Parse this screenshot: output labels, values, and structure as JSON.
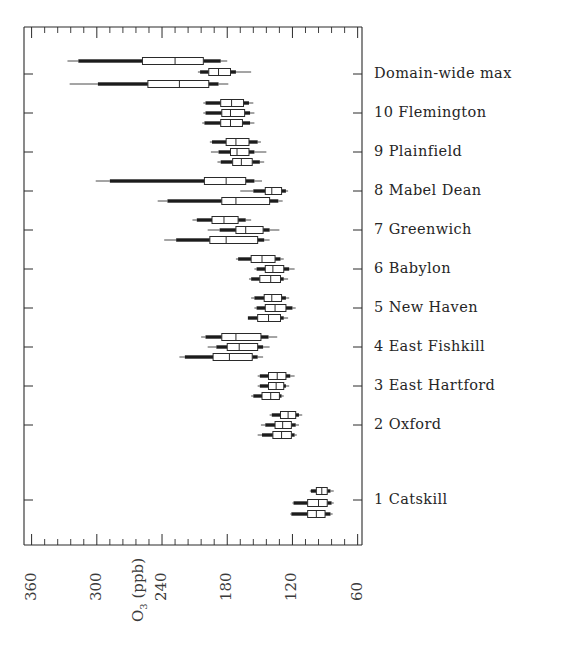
{
  "figure": {
    "kind": "percentile-boxplot-panel",
    "background": "#ffffff",
    "ink": "#1c1c1c"
  },
  "chart_data": {
    "type": "bar",
    "subtype": "horizontal box-and-whisker (percentile) plot, 3 boxes per site",
    "title": "",
    "xlabel": "O₃ (ppb)",
    "ylabel": "",
    "grid": false,
    "legend": "none",
    "x_axis": {
      "label": "O₃ (ppb)",
      "label_main": "O",
      "label_sub": "3",
      "label_unit": "(ppb)",
      "tick_labels": [
        "360",
        "300",
        "240",
        "180",
        "120",
        "60"
      ],
      "tick_values": [
        360,
        300,
        240,
        180,
        120,
        60
      ],
      "range_left_value": 367,
      "range_right_value": 56,
      "reversed": true,
      "minor_ticks_per_interval": 5,
      "ticks_side": "both-top-and-bottom",
      "tick_label_rotation_deg": -90
    },
    "categories": [
      "Domain-wide max",
      "10 Flemington",
      "9 Plainfield",
      "8 Mabel Dean",
      "7 Greenwich",
      "6 Babylon",
      "5 New Haven",
      "4 East Fishkill",
      "3 East Hartford",
      "2 Oxford",
      "1 Catskill"
    ],
    "box_stats_keys": [
      "min",
      "p10",
      "p25",
      "median",
      "p75",
      "p90",
      "max"
    ],
    "groups": [
      {
        "label": "Domain-wide max",
        "label_y": 74,
        "boxes": [
          {
            "y": 61,
            "min": 327,
            "p10": 317,
            "p25": 258,
            "median": 228,
            "p75": 202,
            "p90": 186,
            "max": 180
          },
          {
            "y": 72,
            "min": 207,
            "p10": 205,
            "p25": 197,
            "median": 188,
            "p75": 177,
            "p90": 172,
            "max": 158
          },
          {
            "y": 84,
            "min": 325,
            "p10": 299,
            "p25": 253,
            "median": 224,
            "p75": 197,
            "p90": 188,
            "max": 179
          }
        ]
      },
      {
        "label": "10 Flemington",
        "label_y": 113,
        "boxes": [
          {
            "y": 103,
            "min": 202,
            "p10": 200,
            "p25": 186,
            "median": 176,
            "p75": 165,
            "p90": 160,
            "max": 156
          },
          {
            "y": 113,
            "min": 202,
            "p10": 200,
            "p25": 185,
            "median": 177,
            "p75": 164,
            "p90": 159,
            "max": 155
          },
          {
            "y": 123,
            "min": 203,
            "p10": 201,
            "p25": 186,
            "median": 177,
            "p75": 166,
            "p90": 159,
            "max": 155
          }
        ]
      },
      {
        "label": "9 Plainfield",
        "label_y": 152,
        "boxes": [
          {
            "y": 142,
            "min": 196,
            "p10": 194,
            "p25": 181,
            "median": 172,
            "p75": 160,
            "p90": 152,
            "max": 149
          },
          {
            "y": 152,
            "min": 195,
            "p10": 188,
            "p25": 177,
            "median": 171,
            "p75": 160,
            "p90": 155,
            "max": 144
          },
          {
            "y": 162,
            "min": 189,
            "p10": 186,
            "p25": 175,
            "median": 167,
            "p75": 157,
            "p90": 150,
            "max": 146
          }
        ]
      },
      {
        "label": "8 Mabel Dean",
        "label_y": 191,
        "boxes": [
          {
            "y": 181,
            "min": 301,
            "p10": 288,
            "p25": 201,
            "median": 181,
            "p75": 163,
            "p90": 155,
            "max": 148
          },
          {
            "y": 191,
            "min": 168,
            "p10": 156,
            "p25": 145,
            "median": 139,
            "p75": 130,
            "p90": 126,
            "max": 124
          },
          {
            "y": 201,
            "min": 244,
            "p10": 235,
            "p25": 185,
            "median": 172,
            "p75": 141,
            "p90": 133,
            "max": 129
          }
        ]
      },
      {
        "label": "7 Greenwich",
        "label_y": 230,
        "boxes": [
          {
            "y": 220,
            "min": 212,
            "p10": 208,
            "p25": 194,
            "median": 183,
            "p75": 170,
            "p90": 163,
            "max": 158
          },
          {
            "y": 230,
            "min": 198,
            "p10": 187,
            "p25": 172,
            "median": 163,
            "p75": 147,
            "p90": 141,
            "max": 132
          },
          {
            "y": 240,
            "min": 238,
            "p10": 227,
            "p25": 196,
            "median": 181,
            "p75": 152,
            "p90": 146,
            "max": 141
          }
        ]
      },
      {
        "label": "6 Babylon",
        "label_y": 269,
        "boxes": [
          {
            "y": 259,
            "min": 172,
            "p10": 170,
            "p25": 158,
            "median": 148,
            "p75": 136,
            "p90": 131,
            "max": 128
          },
          {
            "y": 269,
            "min": 155,
            "p10": 153,
            "p25": 145,
            "median": 138,
            "p75": 128,
            "p90": 123,
            "max": 118
          },
          {
            "y": 279,
            "min": 160,
            "p10": 158,
            "p25": 150,
            "median": 140,
            "p75": 131,
            "p90": 128,
            "max": 124
          }
        ]
      },
      {
        "label": "5 New Haven",
        "label_y": 308,
        "boxes": [
          {
            "y": 298,
            "min": 158,
            "p10": 155,
            "p25": 146,
            "median": 139,
            "p75": 130,
            "p90": 126,
            "max": 123
          },
          {
            "y": 308,
            "min": 155,
            "p10": 153,
            "p25": 145,
            "median": 136,
            "p75": 126,
            "p90": 120,
            "max": 117
          },
          {
            "y": 318,
            "min": 161,
            "p10": 161,
            "p25": 152,
            "median": 142,
            "p75": 131,
            "p90": 128,
            "max": 124
          }
        ]
      },
      {
        "label": "4 East Fishkill",
        "label_y": 347,
        "boxes": [
          {
            "y": 337,
            "min": 204,
            "p10": 200,
            "p25": 185,
            "median": 172,
            "p75": 149,
            "p90": 142,
            "max": 134
          },
          {
            "y": 347,
            "min": 198,
            "p10": 190,
            "p25": 180,
            "median": 169,
            "p75": 152,
            "p90": 147,
            "max": 141
          },
          {
            "y": 357,
            "min": 224,
            "p10": 219,
            "p25": 193,
            "median": 178,
            "p75": 157,
            "p90": 152,
            "max": 147
          }
        ]
      },
      {
        "label": "3 East Hartford",
        "label_y": 386,
        "boxes": [
          {
            "y": 376,
            "min": 152,
            "p10": 150,
            "p25": 142,
            "median": 134,
            "p75": 126,
            "p90": 122,
            "max": 118
          },
          {
            "y": 386,
            "min": 152,
            "p10": 150,
            "p25": 142,
            "median": 135,
            "p75": 128,
            "p90": 126,
            "max": 123
          },
          {
            "y": 396,
            "min": 158,
            "p10": 156,
            "p25": 148,
            "median": 140,
            "p75": 132,
            "p90": 130,
            "max": 128
          }
        ]
      },
      {
        "label": "2 Oxford",
        "label_y": 425,
        "boxes": [
          {
            "y": 415,
            "min": 141,
            "p10": 139,
            "p25": 131,
            "median": 124,
            "p75": 117,
            "p90": 114,
            "max": 111
          },
          {
            "y": 425,
            "min": 149,
            "p10": 145,
            "p25": 136,
            "median": 129,
            "p75": 121,
            "p90": 117,
            "max": 114
          },
          {
            "y": 435,
            "min": 152,
            "p10": 148,
            "p25": 138,
            "median": 130,
            "p75": 121,
            "p90": 118,
            "max": 116
          }
        ]
      },
      {
        "label": "1 Catskill",
        "label_y": 500,
        "boxes": [
          {
            "y": 491,
            "min": 104,
            "p10": 103,
            "p25": 98,
            "median": 93,
            "p75": 88,
            "p90": 85,
            "max": 82
          },
          {
            "y": 503,
            "min": 120,
            "p10": 119,
            "p25": 106,
            "median": 96,
            "p75": 88,
            "p90": 84,
            "max": 82
          },
          {
            "y": 514,
            "min": 122,
            "p10": 121,
            "p25": 106,
            "median": 98,
            "p75": 90,
            "p90": 85,
            "max": 83
          }
        ]
      }
    ]
  },
  "geometry": {
    "plot_left_px": 24,
    "plot_right_px": 362,
    "plot_top_px": 27,
    "plot_bottom_px": 545,
    "axis_val_left": 367,
    "axis_val_right": 56
  }
}
